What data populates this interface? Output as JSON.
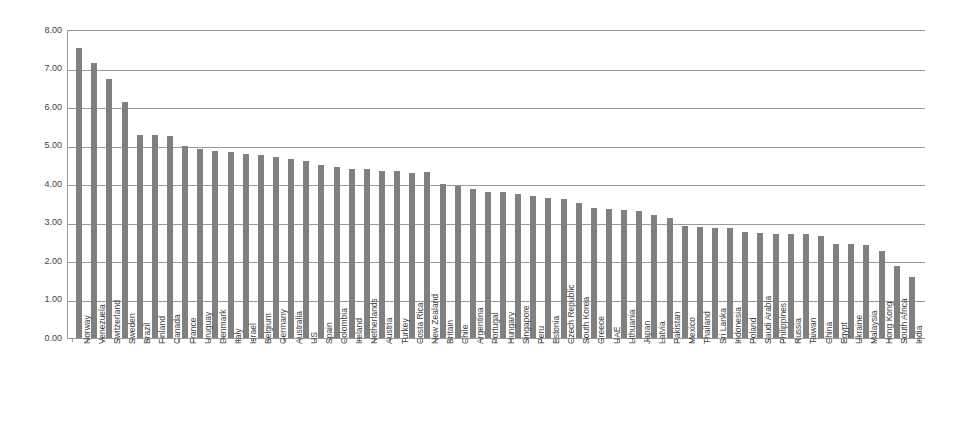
{
  "chart_data": {
    "type": "bar",
    "title": "",
    "subtitle": "",
    "xlabel": "",
    "ylabel": "",
    "ylim": [
      0,
      8
    ],
    "ytick_labels": [
      "8.00",
      "7.00",
      "6.00",
      "5.00",
      "4.00",
      "3.00",
      "2.00",
      "1.00",
      "0.00"
    ],
    "ytick_values": [
      8,
      7,
      6,
      5,
      4,
      3,
      2,
      1,
      0
    ],
    "grid": "horizontal",
    "legend": "none",
    "bar_color": "#808080",
    "axis_color": "#9a9a9a",
    "categories": [
      "Norway",
      "Venezuela",
      "Switzerland",
      "Sweden",
      "Brazil",
      "Finland",
      "Canada",
      "France",
      "Uruguay",
      "Denmark",
      "Italy",
      "Israel",
      "Belgium",
      "Germany",
      "Australia",
      "US",
      "Spain",
      "Colombia",
      "Ireland",
      "Netherlands",
      "Austria",
      "Turkey",
      "Costa Rica",
      "New Zealand",
      "Britain",
      "Chile",
      "Argentina",
      "Portugal",
      "Hungary",
      "Singapore",
      "Peru",
      "Estonia",
      "Czech Republic",
      "South Korea",
      "Greece",
      "UAE",
      "Lithuania",
      "Japan",
      "Latvia",
      "Pakistan",
      "Mexico",
      "Thailand",
      "Sri Lanka",
      "Indonesia",
      "Poland",
      "Saudi Arabia",
      "Philippines",
      "Russia",
      "Taiwan",
      "China",
      "Egypt",
      "Ukraine",
      "Malaysia",
      "Hong Kong",
      "South Africa",
      "India"
    ],
    "values": [
      7.53,
      7.14,
      6.72,
      6.14,
      5.27,
      5.27,
      5.25,
      5.0,
      4.91,
      4.85,
      4.83,
      4.79,
      4.76,
      4.7,
      4.66,
      4.6,
      4.5,
      4.45,
      4.4,
      4.38,
      4.35,
      4.33,
      4.29,
      4.32,
      4.0,
      3.96,
      3.88,
      3.8,
      3.78,
      3.75,
      3.68,
      3.63,
      3.6,
      3.5,
      3.38,
      3.35,
      3.33,
      3.29,
      3.2,
      3.12,
      2.9,
      2.88,
      2.87,
      2.85,
      2.75,
      2.72,
      2.7,
      2.7,
      2.69,
      2.65,
      2.45,
      2.43,
      2.42,
      2.25,
      1.88,
      1.58
    ]
  }
}
